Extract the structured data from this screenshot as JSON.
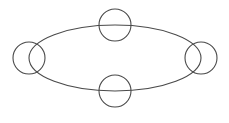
{
  "canvas": {
    "width": 229,
    "height": 123,
    "background": "#ffffff"
  },
  "style": {
    "stroke": "#4a4a4a",
    "stroke_width": 1.1
  },
  "ellipse": {
    "cx": 115,
    "cy": 58,
    "rx": 86,
    "ry": 33
  },
  "nodes": [
    {
      "id": "node-top",
      "cx": 115,
      "cy": 25,
      "r": 16
    },
    {
      "id": "node-right",
      "cx": 201,
      "cy": 58,
      "r": 16
    },
    {
      "id": "node-bottom",
      "cx": 115,
      "cy": 91,
      "r": 16
    },
    {
      "id": "node-left",
      "cx": 29,
      "cy": 58,
      "r": 16
    }
  ]
}
